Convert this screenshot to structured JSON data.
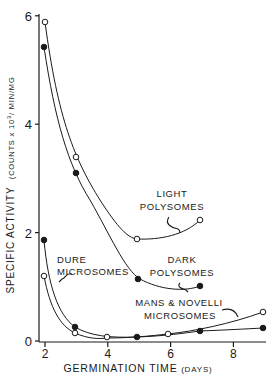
{
  "chart_data": {
    "type": "line",
    "title": "",
    "xlabel": "GERMINATION TIME (DAYS)",
    "xlabel_main": "GERMINATION  TIME",
    "xlabel_unit": "(DAYS)",
    "ylabel": "SPECIFIC ACTIVITY (COUNTS x 10^3/MIN/MG)",
    "ylabel_main": "SPECIFIC  ACTIVITY",
    "ylabel_unit": "(COUNTS x 10",
    "ylabel_exp": "3",
    "ylabel_unit_tail": "/ MIN/MG",
    "xlim": [
      1.8,
      9.2
    ],
    "ylim": [
      0,
      6
    ],
    "x_ticks": [
      2,
      4,
      6,
      8
    ],
    "x_tick_labels": [
      "2",
      "4",
      "6",
      "8"
    ],
    "y_ticks": [
      0,
      2,
      4,
      6
    ],
    "y_tick_labels": [
      "0",
      "2",
      "4",
      "6"
    ],
    "grid": false,
    "legend": "none (inline curve annotations)",
    "series": [
      {
        "name": "Light Polysomes",
        "marker": "open-circle",
        "x": [
          2,
          3,
          5,
          7
        ],
        "values": [
          5.85,
          3.4,
          1.9,
          2.25
        ]
      },
      {
        "name": "Dark Polysomes",
        "marker": "filled-circle",
        "x": [
          2,
          3,
          5,
          7
        ],
        "values": [
          5.45,
          3.1,
          1.15,
          1.0
        ]
      },
      {
        "name": "Dure Microsomes",
        "marker": "filled-circle",
        "x": [
          2,
          3,
          5,
          7,
          9
        ],
        "values": [
          1.87,
          0.26,
          0.09,
          0.17,
          0.24
        ]
      },
      {
        "name": "Mans & Novelli Microsomes",
        "marker": "open-circle",
        "x": [
          2,
          3,
          4,
          6,
          9
        ],
        "values": [
          1.2,
          0.15,
          0.09,
          0.1,
          0.53
        ]
      }
    ],
    "annotations": [
      {
        "line1": "LIGHT",
        "line2": "POLYSOMES"
      },
      {
        "line1": "DARK",
        "line2": "POLYSOMES"
      },
      {
        "line1": "DURE",
        "line2": "MICROSOMES"
      },
      {
        "line1": "MANS & NOVELLI",
        "line2": "MICROSOMES"
      }
    ]
  }
}
